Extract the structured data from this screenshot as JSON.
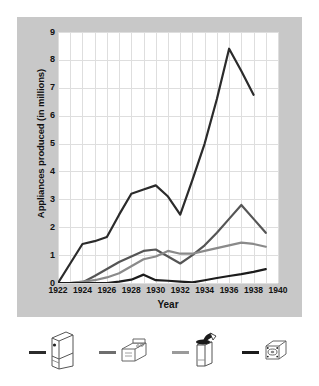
{
  "chart_data": {
    "type": "line",
    "title": "",
    "xlabel": "Year",
    "ylabel": "Appliances produced (in millions)",
    "xlim": [
      1922,
      1940
    ],
    "ylim": [
      0,
      9
    ],
    "xticks": [
      1922,
      1924,
      1926,
      1928,
      1930,
      1932,
      1934,
      1936,
      1938,
      1940
    ],
    "yticks": [
      0,
      1,
      2,
      3,
      4,
      5,
      6,
      7,
      8,
      9
    ],
    "grid": true,
    "legend_position": "below",
    "x": [
      1922,
      1923,
      1924,
      1925,
      1926,
      1927,
      1928,
      1929,
      1930,
      1931,
      1932,
      1933,
      1934,
      1935,
      1936,
      1937,
      1938,
      1939
    ],
    "series": [
      {
        "name": "refrigerator",
        "icon": "refrigerator-icon",
        "color": "#2b2b2b",
        "values": [
          0.0,
          0.7,
          1.4,
          1.5,
          1.65,
          2.45,
          3.2,
          3.35,
          3.5,
          3.1,
          2.45,
          3.7,
          5.0,
          6.6,
          8.4,
          7.6,
          6.75,
          null
        ]
      },
      {
        "name": "stove-range",
        "icon": "stove-icon",
        "color": "#555555",
        "values": [
          0.0,
          0.0,
          0.02,
          0.25,
          0.5,
          0.75,
          0.95,
          1.15,
          1.2,
          0.95,
          0.7,
          1.0,
          1.35,
          1.8,
          2.3,
          2.8,
          2.3,
          1.8
        ]
      },
      {
        "name": "washing-machine",
        "icon": "washing-machine-icon",
        "color": "#8a8a8a",
        "values": [
          0.0,
          0.0,
          0.05,
          0.1,
          0.2,
          0.35,
          0.6,
          0.85,
          0.95,
          1.15,
          1.05,
          1.05,
          1.15,
          1.25,
          1.35,
          1.45,
          1.4,
          1.3
        ]
      },
      {
        "name": "vacuum-cleaner",
        "icon": "vacuum-icon",
        "color": "#1c1c1c",
        "values": [
          0.0,
          0.0,
          0.0,
          0.0,
          0.0,
          0.05,
          0.12,
          0.3,
          0.1,
          0.08,
          0.05,
          0.02,
          0.1,
          0.18,
          0.25,
          0.32,
          0.4,
          0.5
        ]
      }
    ]
  },
  "axis": {
    "y_title": "Appliances produced (in millions)",
    "x_title": "Year",
    "y_labels": [
      "9",
      "8",
      "7",
      "6",
      "5",
      "4",
      "3",
      "2",
      "1",
      "0"
    ],
    "x_labels": [
      "1922",
      "1924",
      "1926",
      "1928",
      "1930",
      "1932",
      "1934",
      "1936",
      "1938",
      "1940"
    ]
  },
  "legend": {
    "items": [
      {
        "icon": "refrigerator-icon",
        "color": "#2b2b2b"
      },
      {
        "icon": "stove-icon",
        "color": "#6e6e6e"
      },
      {
        "icon": "washing-machine-icon",
        "color": "#9a9a9a"
      },
      {
        "icon": "vacuum-icon",
        "color": "#1c1c1c"
      }
    ]
  },
  "colors": {
    "panel": "#c8c8c8",
    "plot_bg": "#ffffff",
    "grid": "#dedede",
    "text": "#111111"
  }
}
